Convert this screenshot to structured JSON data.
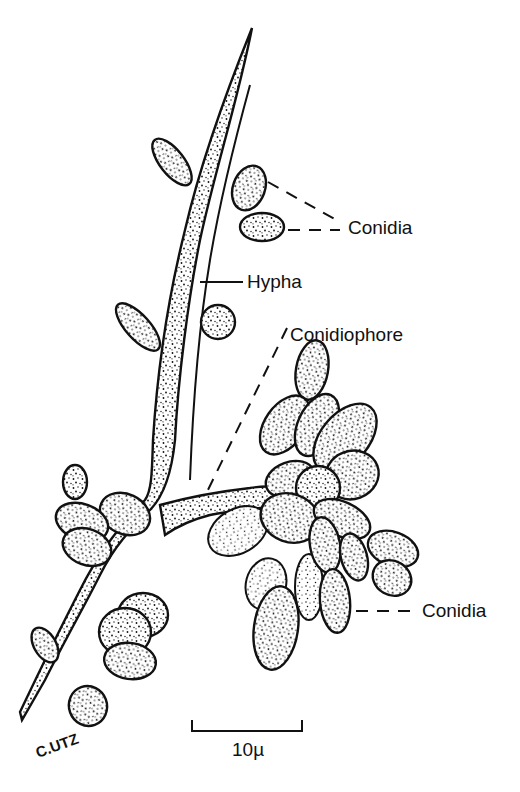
{
  "figure": {
    "labels": {
      "conidia_top": "Conidia",
      "hypha": "Hypha",
      "conidiophore": "Conidiophore",
      "conidia_bottom": "Conidia"
    },
    "scale_bar": {
      "label": "10µ",
      "length_units": 10,
      "unit": "µ"
    },
    "signature": "C.UTZ",
    "colors": {
      "ink": "#111111",
      "background": "#ffffff"
    }
  }
}
